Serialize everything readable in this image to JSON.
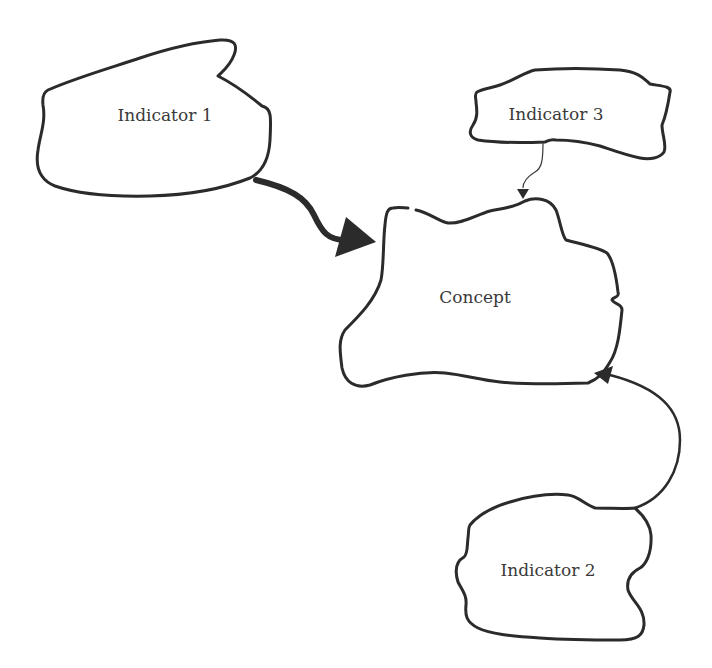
{
  "diagram": {
    "nodes": [
      {
        "id": "indicator1",
        "label": "Indicator 1",
        "x": 165,
        "y": 115
      },
      {
        "id": "indicator3",
        "label": "Indicator 3",
        "x": 556,
        "y": 114
      },
      {
        "id": "concept",
        "label": "Concept",
        "x": 475,
        "y": 297
      },
      {
        "id": "indicator2",
        "label": "Indicator 2",
        "x": 548,
        "y": 570
      }
    ],
    "edges": [
      {
        "from": "Indicator 1",
        "to": "Concept",
        "weight": "thick"
      },
      {
        "from": "Indicator 3",
        "to": "Concept",
        "weight": "thin"
      },
      {
        "from": "Indicator 2",
        "to": "Concept",
        "weight": "medium"
      }
    ],
    "colors": {
      "stroke": "#2b2b2b",
      "text": "#3a3a3a",
      "background": "#ffffff"
    }
  }
}
